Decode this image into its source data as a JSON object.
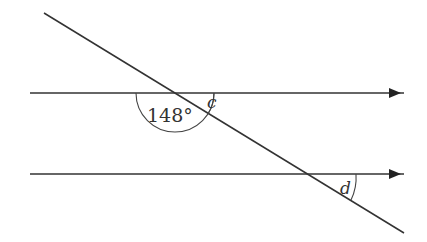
{
  "diagram": {
    "type": "parallel-lines-transversal",
    "stroke_color": "#333333",
    "labels": {
      "given_angle": "148°",
      "angle_c": "c",
      "angle_d": "d"
    },
    "lines": {
      "parallel_top": {
        "x1": 30,
        "y1": 93,
        "x2": 404,
        "y2": 93,
        "arrow": true
      },
      "parallel_bottom": {
        "x1": 30,
        "y1": 174,
        "x2": 404,
        "y2": 174,
        "arrow": true
      },
      "transversal": {
        "x1": 44,
        "y1": 13,
        "x2": 404,
        "y2": 233
      }
    }
  }
}
